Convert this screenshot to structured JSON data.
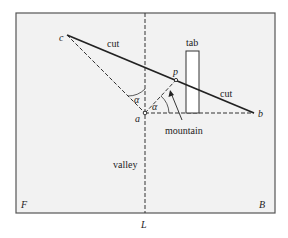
{
  "diagram": {
    "type": "fold-and-cut diagram",
    "labels": {
      "c": "c",
      "a": "a",
      "b": "b",
      "p": "p",
      "alpha_left": "α",
      "alpha_right": "α",
      "cut_upper": "cut",
      "cut_lower": "cut",
      "tab": "tab",
      "mountain": "mountain",
      "valley": "valley",
      "front": "F",
      "back": "B",
      "fold_line": "L"
    },
    "colors": {
      "frame_fill": "#f2f2f2",
      "frame_stroke": "#555555",
      "line": "#222222",
      "tab_fill": "#ffffff"
    }
  }
}
